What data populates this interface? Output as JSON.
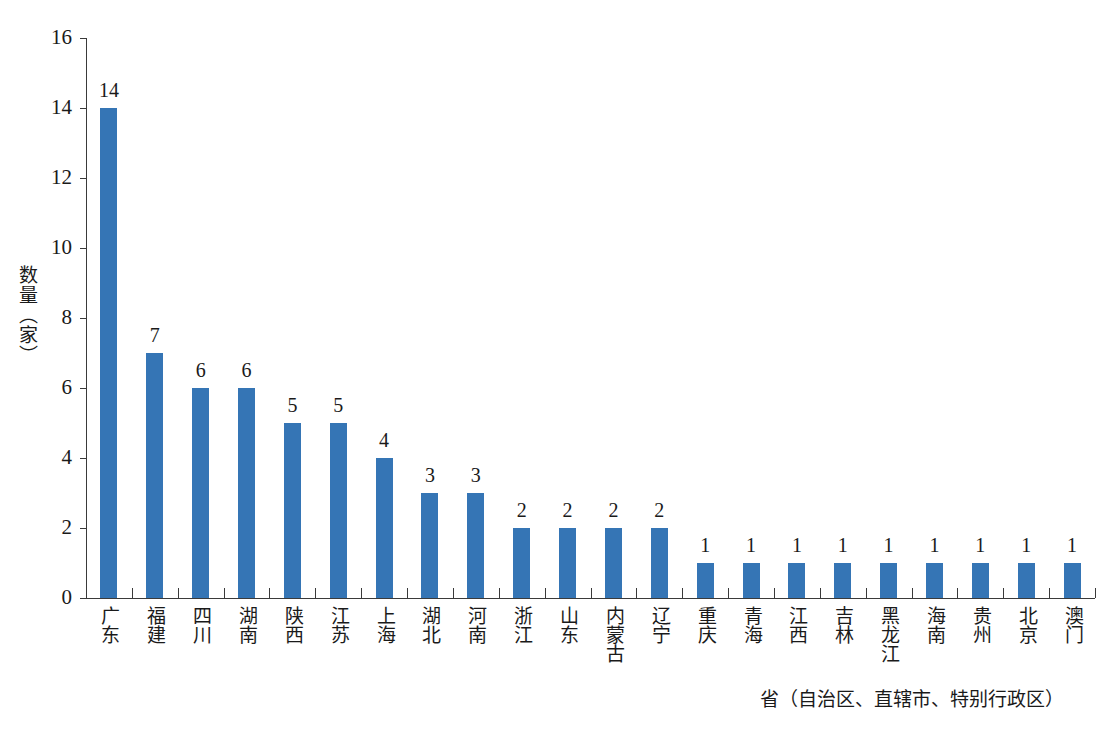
{
  "chart_data": {
    "type": "bar",
    "title": "",
    "subtitle": "",
    "xlabel": "省（自治区、直辖市、特别行政区）",
    "ylabel": "数量（家）",
    "categories": [
      "广东",
      "福建",
      "四川",
      "湖南",
      "陕西",
      "江苏",
      "上海",
      "湖北",
      "河南",
      "浙江",
      "山东",
      "内蒙古",
      "辽宁",
      "重庆",
      "青海",
      "江西",
      "吉林",
      "黑龙江",
      "海南",
      "贵州",
      "北京",
      "澳门"
    ],
    "values": [
      14,
      7,
      6,
      6,
      5,
      5,
      4,
      3,
      3,
      2,
      2,
      2,
      2,
      1,
      1,
      1,
      1,
      1,
      1,
      1,
      1,
      1
    ],
    "data_labels": [
      "14",
      "7",
      "6",
      "6",
      "5",
      "5",
      "4",
      "3",
      "3",
      "2",
      "2",
      "2",
      "2",
      "1",
      "1",
      "1",
      "1",
      "1",
      "1",
      "1",
      "1",
      "1"
    ],
    "ylim": [
      0,
      16
    ],
    "y_ticks": [
      0,
      2,
      4,
      6,
      8,
      10,
      12,
      14,
      16
    ],
    "y_tick_labels": [
      "0",
      "2",
      "4",
      "6",
      "8",
      "10",
      "12",
      "14",
      "16"
    ],
    "grid": false,
    "legend": null,
    "legend_position": "none",
    "bar_color": "#3575b5",
    "axis_color": "#3a3a3a",
    "text_color": "#1a1a1a",
    "background": "#ffffff"
  }
}
